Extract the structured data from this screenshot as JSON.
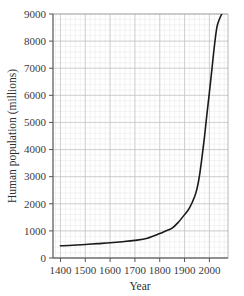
{
  "chart_data": {
    "type": "line",
    "title": "",
    "xlabel": "Year",
    "ylabel": "Human population (millions)",
    "xlim": [
      1370,
      2075
    ],
    "ylim": [
      0,
      9000
    ],
    "grid": true,
    "legend": "none",
    "line_color": "#1a1a1a",
    "x_ticks": [
      1400,
      1500,
      1600,
      1700,
      1800,
      1900,
      2000
    ],
    "x_tick_labels": [
      "1400",
      "1500",
      "1600",
      "1700",
      "1800",
      "1900",
      "2000"
    ],
    "y_ticks": [
      0,
      1000,
      2000,
      3000,
      4000,
      5000,
      6000,
      7000,
      8000,
      9000
    ],
    "y_tick_labels": [
      "0",
      "1000",
      "2000",
      "3000",
      "4000",
      "5000",
      "6000",
      "7000",
      "8000",
      "9000"
    ],
    "x": [
      1400,
      1450,
      1500,
      1550,
      1600,
      1650,
      1700,
      1750,
      1800,
      1820,
      1850,
      1875,
      1900,
      1920,
      1940,
      1950,
      1960,
      1970,
      1980,
      1990,
      2000,
      2010,
      2020,
      2030,
      2040,
      2050
    ],
    "series": [
      {
        "name": "Human population",
        "values": [
          450,
          470,
          500,
          530,
          560,
          600,
          650,
          730,
          900,
          980,
          1100,
          1320,
          1600,
          1850,
          2250,
          2550,
          3030,
          3700,
          4440,
          5300,
          6100,
          6950,
          7800,
          8500,
          8800,
          9000
        ]
      }
    ]
  },
  "axes": {
    "y_title": "Human population (millions)",
    "x_title": "Year"
  }
}
